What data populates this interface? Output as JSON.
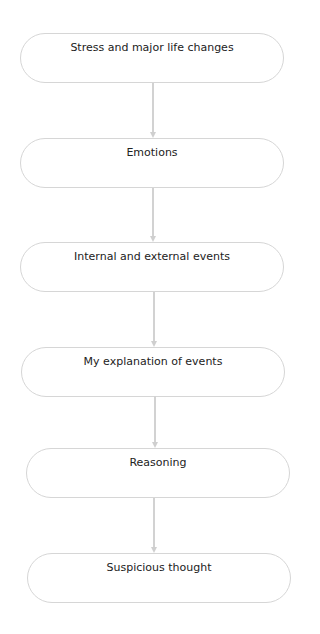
{
  "diagram": {
    "type": "vertical-flowchart",
    "colors": {
      "node_border": "#d6d6d6",
      "connector": "#d2d2d2",
      "text": "#222222",
      "background": "#ffffff"
    },
    "nodes": [
      {
        "id": "n1",
        "label": "Stress and major life changes"
      },
      {
        "id": "n2",
        "label": "Emotions"
      },
      {
        "id": "n3",
        "label": "Internal and external events"
      },
      {
        "id": "n4",
        "label": "My explanation of events"
      },
      {
        "id": "n5",
        "label": "Reasoning"
      },
      {
        "id": "n6",
        "label": "Suspicious thought"
      }
    ],
    "edges": [
      {
        "from": "n1",
        "to": "n2"
      },
      {
        "from": "n2",
        "to": "n3"
      },
      {
        "from": "n3",
        "to": "n4"
      },
      {
        "from": "n4",
        "to": "n5"
      },
      {
        "from": "n5",
        "to": "n6"
      }
    ]
  }
}
